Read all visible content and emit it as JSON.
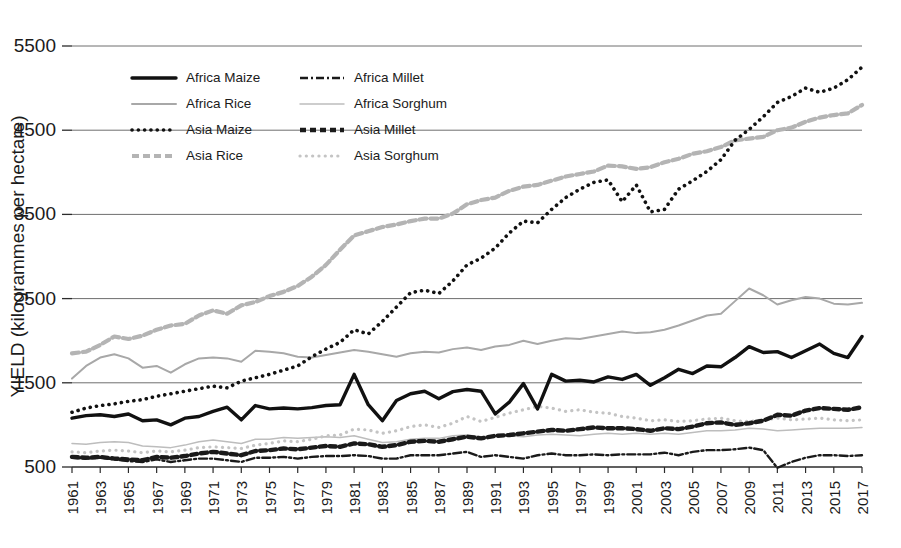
{
  "chart_data": {
    "type": "line",
    "title": "",
    "xlabel": "",
    "ylabel": "YIELD (kilogrammes per hectare)",
    "ylim": [
      500,
      5500
    ],
    "yticks": [
      500,
      1500,
      2500,
      3500,
      4500,
      5500
    ],
    "xlim": [
      1961,
      2017
    ],
    "grid": true,
    "legend_position": "top-left-inside",
    "x": [
      1961,
      1962,
      1963,
      1964,
      1965,
      1966,
      1967,
      1968,
      1969,
      1970,
      1971,
      1972,
      1973,
      1974,
      1975,
      1976,
      1977,
      1978,
      1979,
      1980,
      1981,
      1982,
      1983,
      1984,
      1985,
      1986,
      1987,
      1988,
      1989,
      1990,
      1991,
      1992,
      1993,
      1994,
      1995,
      1996,
      1997,
      1998,
      1999,
      2000,
      2001,
      2002,
      2003,
      2004,
      2005,
      2006,
      2007,
      2008,
      2009,
      2010,
      2011,
      2012,
      2013,
      2014,
      2015,
      2016,
      2017
    ],
    "xtick_labels": [
      "1961",
      "1963",
      "1965",
      "1967",
      "1969",
      "1971",
      "1973",
      "1975",
      "1977",
      "1979",
      "1981",
      "1983",
      "1985",
      "1987",
      "1989",
      "1991",
      "1993",
      "1995",
      "1997",
      "1999",
      "2001",
      "2003",
      "2005",
      "2007",
      "2009",
      "2011",
      "2013",
      "2015",
      "2017"
    ],
    "series": [
      {
        "name": "Africa Maize",
        "style": "solid-thick-black",
        "color": "#111111",
        "values": [
          1080,
          1110,
          1120,
          1100,
          1130,
          1050,
          1060,
          1000,
          1080,
          1100,
          1160,
          1210,
          1060,
          1230,
          1190,
          1200,
          1190,
          1205,
          1230,
          1240,
          1600,
          1240,
          1050,
          1290,
          1370,
          1400,
          1310,
          1395,
          1420,
          1400,
          1130,
          1270,
          1490,
          1190,
          1600,
          1520,
          1530,
          1510,
          1570,
          1540,
          1600,
          1470,
          1560,
          1660,
          1610,
          1700,
          1690,
          1800,
          1930,
          1860,
          1870,
          1800,
          1880,
          1960,
          1850,
          1800,
          2050
        ]
      },
      {
        "name": "Africa Millet",
        "style": "dashdot-black",
        "color": "#1a1a1a",
        "values": [
          610,
          600,
          610,
          590,
          570,
          560,
          590,
          560,
          580,
          600,
          600,
          580,
          560,
          610,
          610,
          620,
          600,
          620,
          630,
          630,
          640,
          630,
          600,
          600,
          640,
          640,
          640,
          660,
          680,
          620,
          640,
          620,
          600,
          640,
          660,
          640,
          640,
          650,
          640,
          650,
          650,
          650,
          670,
          640,
          680,
          700,
          700,
          710,
          730,
          700,
          490,
          560,
          610,
          640,
          640,
          630,
          640
        ]
      },
      {
        "name": "Africa Rice",
        "style": "solid-gray",
        "color": "#a8a8a8",
        "values": [
          1550,
          1700,
          1800,
          1840,
          1790,
          1680,
          1700,
          1620,
          1720,
          1790,
          1800,
          1790,
          1750,
          1880,
          1870,
          1850,
          1810,
          1800,
          1830,
          1860,
          1890,
          1870,
          1840,
          1810,
          1850,
          1870,
          1860,
          1900,
          1920,
          1890,
          1930,
          1950,
          2000,
          1960,
          2000,
          2030,
          2020,
          2050,
          2080,
          2110,
          2090,
          2100,
          2130,
          2180,
          2240,
          2300,
          2320,
          2470,
          2620,
          2540,
          2430,
          2480,
          2520,
          2500,
          2440,
          2430,
          2450
        ]
      },
      {
        "name": "Africa Sorghum",
        "style": "solid-thin-lightgray",
        "color": "#bdbdbd",
        "values": [
          780,
          770,
          790,
          800,
          790,
          750,
          740,
          730,
          760,
          800,
          820,
          800,
          780,
          830,
          830,
          850,
          840,
          850,
          860,
          850,
          870,
          830,
          790,
          800,
          830,
          840,
          840,
          870,
          880,
          860,
          870,
          870,
          860,
          880,
          890,
          880,
          870,
          890,
          900,
          890,
          900,
          890,
          900,
          890,
          910,
          930,
          930,
          940,
          960,
          950,
          930,
          940,
          950,
          960,
          960,
          960,
          970
        ]
      },
      {
        "name": "Asia Maize",
        "style": "dotted-black",
        "color": "#111111",
        "values": [
          1150,
          1200,
          1230,
          1250,
          1280,
          1300,
          1340,
          1370,
          1400,
          1430,
          1460,
          1440,
          1520,
          1560,
          1600,
          1650,
          1700,
          1810,
          1900,
          1980,
          2130,
          2080,
          2230,
          2400,
          2570,
          2600,
          2560,
          2710,
          2900,
          2980,
          3100,
          3280,
          3420,
          3400,
          3560,
          3700,
          3800,
          3880,
          3910,
          3650,
          3850,
          3530,
          3560,
          3800,
          3900,
          4010,
          4150,
          4380,
          4510,
          4660,
          4830,
          4900,
          5000,
          4950,
          5000,
          5100,
          5250
        ]
      },
      {
        "name": "Asia Millet",
        "style": "dashed-thick-black",
        "color": "#1a1a1a",
        "values": [
          620,
          610,
          620,
          600,
          590,
          580,
          620,
          610,
          630,
          660,
          680,
          660,
          640,
          690,
          700,
          720,
          710,
          730,
          750,
          740,
          780,
          770,
          740,
          760,
          800,
          810,
          800,
          830,
          860,
          840,
          870,
          880,
          900,
          920,
          940,
          930,
          950,
          970,
          960,
          960,
          950,
          930,
          960,
          950,
          980,
          1020,
          1030,
          1000,
          1020,
          1050,
          1120,
          1110,
          1170,
          1200,
          1190,
          1180,
          1210
        ]
      },
      {
        "name": "Asia Rice",
        "style": "dashed-gray",
        "color": "#b4b4b4",
        "values": [
          1850,
          1870,
          1950,
          2050,
          2020,
          2060,
          2130,
          2180,
          2200,
          2300,
          2360,
          2320,
          2420,
          2460,
          2530,
          2580,
          2650,
          2760,
          2900,
          3080,
          3250,
          3300,
          3350,
          3380,
          3420,
          3450,
          3450,
          3510,
          3620,
          3670,
          3700,
          3780,
          3830,
          3850,
          3900,
          3950,
          3980,
          4010,
          4080,
          4070,
          4040,
          4060,
          4120,
          4160,
          4220,
          4250,
          4300,
          4380,
          4400,
          4420,
          4500,
          4530,
          4600,
          4650,
          4680,
          4700,
          4800
        ]
      },
      {
        "name": "Asia Sorghum",
        "style": "dotted-lightgray",
        "color": "#c4c4c4",
        "values": [
          680,
          670,
          690,
          700,
          690,
          670,
          690,
          680,
          700,
          730,
          740,
          730,
          720,
          760,
          780,
          810,
          800,
          830,
          870,
          880,
          950,
          940,
          900,
          930,
          980,
          1000,
          970,
          1020,
          1100,
          1040,
          1090,
          1140,
          1180,
          1220,
          1200,
          1160,
          1180,
          1150,
          1140,
          1100,
          1080,
          1050,
          1060,
          1040,
          1050,
          1070,
          1080,
          1050,
          1040,
          1060,
          1080,
          1060,
          1070,
          1080,
          1060,
          1050,
          1060
        ]
      }
    ]
  },
  "legend": {
    "entries": [
      {
        "label": "Africa Maize"
      },
      {
        "label": "Asia Maize"
      },
      {
        "label": "Africa Millet"
      },
      {
        "label": "Asia Millet"
      },
      {
        "label": "Africa Rice"
      },
      {
        "label": "Asia Rice"
      },
      {
        "label": "Africa Sorghum"
      },
      {
        "label": "Asia Sorghum"
      }
    ]
  }
}
